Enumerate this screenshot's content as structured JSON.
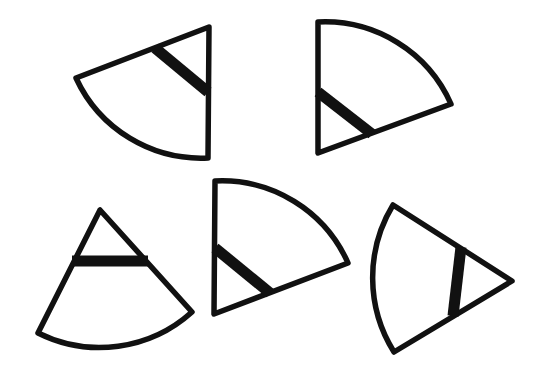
{
  "diagram": {
    "stroke_color": "#111111",
    "background_color": "#ffffff",
    "shapes": [
      {
        "id": "sector-1",
        "apex": [
          209,
          27
        ],
        "p1": [
          76,
          78
        ],
        "p2": [
          208,
          158
        ],
        "radius": 138,
        "sweep": 0,
        "bar": [
          [
            155,
            48
          ],
          [
            208,
            92
          ]
        ]
      },
      {
        "id": "sector-2",
        "apex": [
          318,
          153
        ],
        "p1": [
          318,
          22
        ],
        "p2": [
          451,
          104
        ],
        "radius": 138,
        "sweep": 1,
        "bar": [
          [
            318,
            92
          ],
          [
            372,
            134
          ]
        ]
      },
      {
        "id": "sector-3",
        "apex": [
          100,
          210
        ],
        "p1": [
          38,
          333
        ],
        "p2": [
          192,
          312
        ],
        "radius": 138,
        "sweep": 0,
        "bar": [
          [
            72,
            261
          ],
          [
            148,
            261
          ]
        ]
      },
      {
        "id": "sector-4",
        "apex": [
          214,
          314
        ],
        "p1": [
          215,
          181
        ],
        "p2": [
          348,
          263
        ],
        "radius": 138,
        "sweep": 1,
        "bar": [
          [
            215,
            248
          ],
          [
            270,
            293
          ]
        ]
      },
      {
        "id": "sector-5",
        "apex": [
          512,
          281
        ],
        "p1": [
          393,
          205
        ],
        "p2": [
          394,
          352
        ],
        "radius": 140,
        "sweep": 0,
        "bar": [
          [
            461,
            247
          ],
          [
            453,
            316
          ]
        ]
      }
    ]
  }
}
